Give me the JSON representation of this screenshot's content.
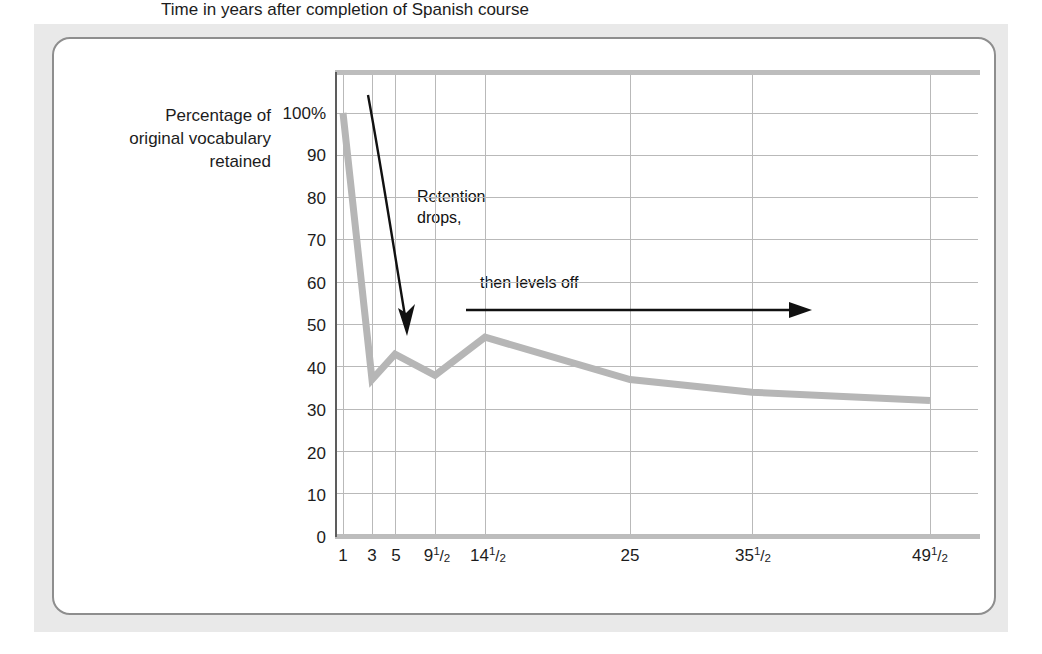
{
  "figure": {
    "y_axis_title": "Percentage of\noriginal vocabulary\nretained",
    "x_axis_title": "Time in years after completion of Spanish course",
    "annotation_1": "Retention\ndrops,",
    "annotation_2": "then levels off",
    "line_color": "#b6b6b6",
    "grid_color": "#b9b9b9",
    "axis_color": "#8a8a8a",
    "text_color": "#1c1c1c",
    "card_border_color": "#8e8e8e",
    "backdrop_color": "#e9e9e9"
  },
  "chart_data": {
    "type": "line",
    "title": "",
    "xlabel": "Time in years after completion of Spanish course",
    "ylabel": "Percentage of original vocabulary retained",
    "x_tick_labels": [
      "1",
      "3",
      "5",
      "9½",
      "14½",
      "25",
      "35½",
      "49½"
    ],
    "x_values": [
      1,
      3,
      5,
      9.5,
      14.5,
      25,
      35.5,
      49.5
    ],
    "y_tick_labels": [
      "0",
      "10",
      "20",
      "30",
      "40",
      "50",
      "60",
      "70",
      "80",
      "90",
      "100%"
    ],
    "y_ticks": [
      0,
      10,
      20,
      30,
      40,
      50,
      60,
      70,
      80,
      90,
      100
    ],
    "ylim": [
      0,
      100
    ],
    "grid": true,
    "legend": "none",
    "series": [
      {
        "name": "Percentage of original vocabulary retained",
        "values": [
          100,
          37,
          43,
          38,
          47,
          37,
          34,
          32
        ]
      }
    ],
    "annotations": [
      {
        "text": "Retention drops,",
        "kind": "arrow-down"
      },
      {
        "text": "then levels off",
        "kind": "arrow-right"
      }
    ]
  }
}
